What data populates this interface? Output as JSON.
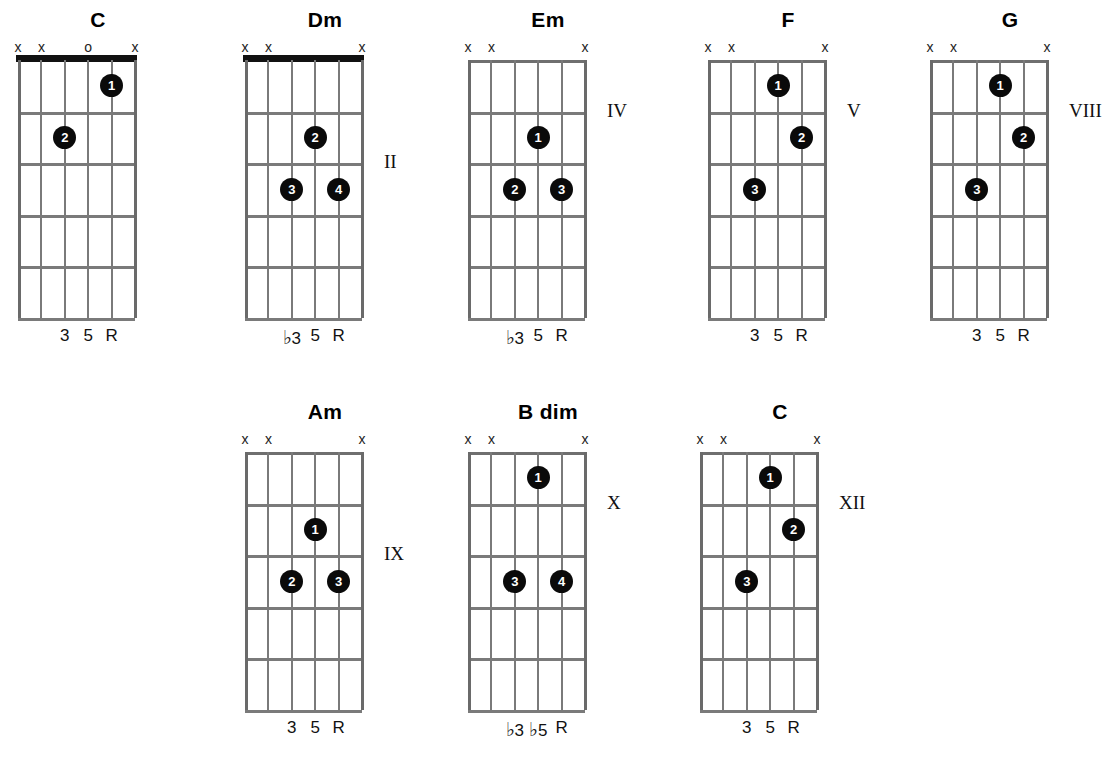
{
  "page": {
    "background": "#ffffff",
    "dot_color": "#0a0a0a",
    "line_color": "#7a7a7a",
    "nut_color": "#111111"
  },
  "legend": {
    "muted_symbol": "x",
    "open_symbol": "o",
    "root_symbol": "R",
    "flat_symbol": "♭"
  },
  "chords": [
    {
      "name": "C",
      "x": 18,
      "y": 8,
      "has_nut": true,
      "position_label": "",
      "position_label_fret": 0,
      "string_markers": [
        "x",
        "x",
        "",
        "o",
        "",
        "x"
      ],
      "dots": [
        {
          "finger": "1",
          "string": 5,
          "fret": 1
        },
        {
          "finger": "2",
          "string": 3,
          "fret": 2
        }
      ],
      "intervals": [
        {
          "string": 3,
          "text": "3",
          "flat": false
        },
        {
          "string": 4,
          "text": "5",
          "flat": false
        },
        {
          "string": 5,
          "text": "R",
          "flat": false
        }
      ]
    },
    {
      "name": "Dm",
      "x": 245,
      "y": 8,
      "has_nut": true,
      "position_label": "II",
      "position_label_fret": 2,
      "string_markers": [
        "x",
        "x",
        "",
        "",
        "",
        "x"
      ],
      "dots": [
        {
          "finger": "2",
          "string": 4,
          "fret": 2
        },
        {
          "finger": "3",
          "string": 3,
          "fret": 3
        },
        {
          "finger": "4",
          "string": 5,
          "fret": 3
        }
      ],
      "intervals": [
        {
          "string": 3,
          "text": "3",
          "flat": true
        },
        {
          "string": 4,
          "text": "5",
          "flat": false
        },
        {
          "string": 5,
          "text": "R",
          "flat": false
        }
      ]
    },
    {
      "name": "Em",
      "x": 468,
      "y": 8,
      "has_nut": false,
      "position_label": "IV",
      "position_label_fret": 1,
      "string_markers": [
        "x",
        "x",
        "",
        "",
        "",
        "x"
      ],
      "dots": [
        {
          "finger": "1",
          "string": 4,
          "fret": 2
        },
        {
          "finger": "2",
          "string": 3,
          "fret": 3
        },
        {
          "finger": "3",
          "string": 5,
          "fret": 3
        }
      ],
      "intervals": [
        {
          "string": 3,
          "text": "3",
          "flat": true
        },
        {
          "string": 4,
          "text": "5",
          "flat": false
        },
        {
          "string": 5,
          "text": "R",
          "flat": false
        }
      ]
    },
    {
      "name": "F",
      "x": 708,
      "y": 8,
      "has_nut": false,
      "position_label": "V",
      "position_label_fret": 1,
      "string_markers": [
        "x",
        "x",
        "",
        "",
        "",
        "x"
      ],
      "dots": [
        {
          "finger": "1",
          "string": 4,
          "fret": 1
        },
        {
          "finger": "2",
          "string": 5,
          "fret": 2
        },
        {
          "finger": "3",
          "string": 3,
          "fret": 3
        }
      ],
      "intervals": [
        {
          "string": 3,
          "text": "3",
          "flat": false
        },
        {
          "string": 4,
          "text": "5",
          "flat": false
        },
        {
          "string": 5,
          "text": "R",
          "flat": false
        }
      ]
    },
    {
      "name": "G",
      "x": 930,
      "y": 8,
      "has_nut": false,
      "position_label": "VIII",
      "position_label_fret": 1,
      "string_markers": [
        "x",
        "x",
        "",
        "",
        "",
        "x"
      ],
      "dots": [
        {
          "finger": "1",
          "string": 4,
          "fret": 1
        },
        {
          "finger": "2",
          "string": 5,
          "fret": 2
        },
        {
          "finger": "3",
          "string": 3,
          "fret": 3
        }
      ],
      "intervals": [
        {
          "string": 3,
          "text": "3",
          "flat": false
        },
        {
          "string": 4,
          "text": "5",
          "flat": false
        },
        {
          "string": 5,
          "text": "R",
          "flat": false
        }
      ]
    },
    {
      "name": "Am",
      "x": 245,
      "y": 400,
      "has_nut": false,
      "position_label": "IX",
      "position_label_fret": 2,
      "string_markers": [
        "x",
        "x",
        "",
        "",
        "",
        "x"
      ],
      "dots": [
        {
          "finger": "1",
          "string": 4,
          "fret": 2
        },
        {
          "finger": "2",
          "string": 3,
          "fret": 3
        },
        {
          "finger": "3",
          "string": 5,
          "fret": 3
        }
      ],
      "intervals": [
        {
          "string": 3,
          "text": "3",
          "flat": false
        },
        {
          "string": 4,
          "text": "5",
          "flat": false
        },
        {
          "string": 5,
          "text": "R",
          "flat": false
        }
      ]
    },
    {
      "name": "B dim",
      "x": 468,
      "y": 400,
      "has_nut": false,
      "position_label": "X",
      "position_label_fret": 1,
      "string_markers": [
        "x",
        "x",
        "",
        "",
        "",
        "x"
      ],
      "dots": [
        {
          "finger": "1",
          "string": 4,
          "fret": 1
        },
        {
          "finger": "3",
          "string": 3,
          "fret": 3
        },
        {
          "finger": "4",
          "string": 5,
          "fret": 3
        }
      ],
      "intervals": [
        {
          "string": 3,
          "text": "3",
          "flat": true
        },
        {
          "string": 4,
          "text": "5",
          "flat": true
        },
        {
          "string": 5,
          "text": "R",
          "flat": false
        }
      ]
    },
    {
      "name": "C",
      "x": 700,
      "y": 400,
      "has_nut": false,
      "position_label": "XII",
      "position_label_fret": 1,
      "string_markers": [
        "x",
        "x",
        "",
        "",
        "",
        "x"
      ],
      "dots": [
        {
          "finger": "1",
          "string": 4,
          "fret": 1
        },
        {
          "finger": "2",
          "string": 5,
          "fret": 2
        },
        {
          "finger": "3",
          "string": 3,
          "fret": 3
        }
      ],
      "intervals": [
        {
          "string": 3,
          "text": "3",
          "flat": false
        },
        {
          "string": 4,
          "text": "5",
          "flat": false
        },
        {
          "string": 5,
          "text": "R",
          "flat": false
        }
      ]
    }
  ]
}
